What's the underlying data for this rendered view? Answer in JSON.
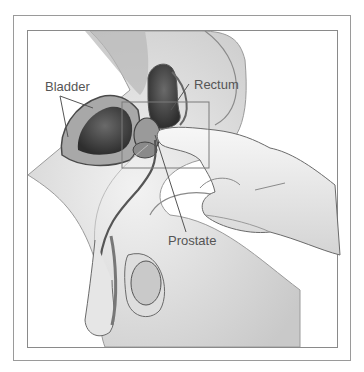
{
  "figure": {
    "labels": {
      "bladder": "Bladder",
      "rectum": "Rectum",
      "prostate": "Prostate"
    },
    "colors": {
      "frame": "#9a9a9a",
      "label_text": "#555555",
      "leader_line": "#555555",
      "tissue_dark": "#3a3a3a",
      "tissue_mid": "#8c8c8c",
      "tissue_light": "#d9d9d9",
      "background": "#ffffff"
    }
  }
}
